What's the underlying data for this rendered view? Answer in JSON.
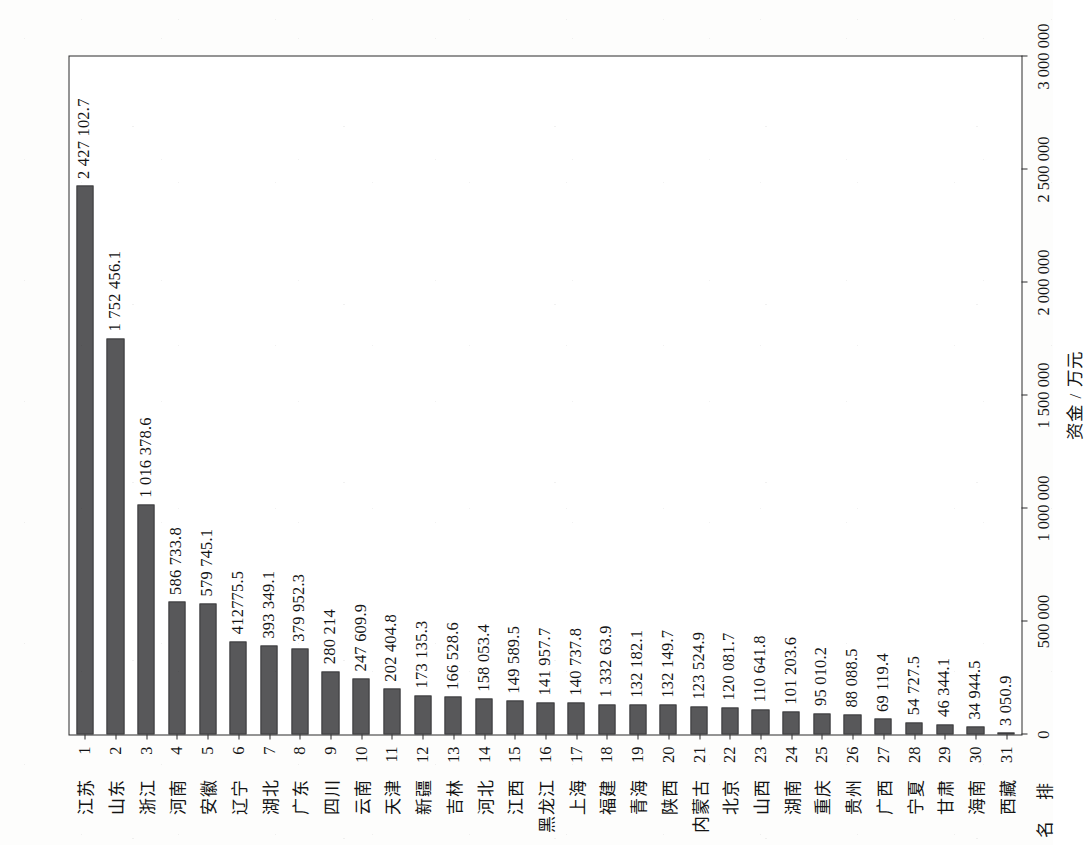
{
  "chart_data": {
    "type": "bar",
    "orientation": "vertical-bars-on-rotated-page",
    "title": "",
    "xlabel": "排 名",
    "ylabel": "资金 / 万元",
    "name_header": "名",
    "rank_header": "排",
    "ylim": [
      0,
      3000000
    ],
    "grid": false,
    "legend": null,
    "axis_ticks": [
      "0",
      "500 000",
      "1 000 000",
      "1 500 000",
      "2 000 000",
      "2 500 000",
      "3 000 000"
    ],
    "axis_tick_values": [
      0,
      500000,
      1000000,
      1500000,
      2000000,
      2500000,
      3000000
    ],
    "categories": [
      "江苏",
      "山东",
      "浙江",
      "河南",
      "安徽",
      "辽宁",
      "湖北",
      "广东",
      "四川",
      "云南",
      "天津",
      "新疆",
      "吉林",
      "河北",
      "江西",
      "黑龙江",
      "上海",
      "福建",
      "青海",
      "陕西",
      "内蒙古",
      "北京",
      "山西",
      "湖南",
      "重庆",
      "贵州",
      "广西",
      "宁夏",
      "甘肃",
      "海南",
      "西藏"
    ],
    "ranks": [
      "1",
      "2",
      "3",
      "4",
      "5",
      "6",
      "7",
      "8",
      "9",
      "10",
      "11",
      "12",
      "13",
      "14",
      "15",
      "16",
      "17",
      "18",
      "19",
      "20",
      "21",
      "22",
      "23",
      "24",
      "25",
      "26",
      "27",
      "28",
      "29",
      "30",
      "31"
    ],
    "values": [
      2427102.7,
      1752456.1,
      1016378.6,
      586733.8,
      579745.5,
      412775.5,
      393349.1,
      379952.3,
      280214,
      247609.9,
      202404.8,
      173135.3,
      166528.6,
      158053.4,
      149589.5,
      141957.7,
      140737.8,
      133263.9,
      132182.1,
      132149.7,
      123524.9,
      120081.7,
      110641.8,
      101203.6,
      95010.2,
      88088.5,
      69119.4,
      54727.5,
      46344.1,
      34944.5,
      3050.9
    ],
    "value_labels": [
      "2 427 102.7",
      "1 752 456.1",
      "1 016 378.6",
      "586 733.8",
      "579 745.1",
      "412775.5",
      "393 349.1",
      "379 952.3",
      "280 214",
      "247 609.9",
      "202 404.8",
      "173 135.3",
      "166 528.6",
      "158 053.4",
      "149 589.5",
      "141 957.7",
      "140 737.8",
      "1 332 63.9",
      "132 182.1",
      "132 149.7",
      "123 524.9",
      "120 081.7",
      "110 641.8",
      "101 203.6",
      "95 010.2",
      "88 088.5",
      "69 119.4",
      "54 727.5",
      "46 344.1",
      "34 944.5",
      "3 050.9"
    ],
    "bar_color": "#58585a",
    "frame_color": "#2a2a2a",
    "text_color": "#131313"
  }
}
